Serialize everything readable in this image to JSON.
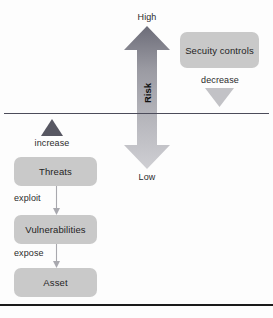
{
  "diagram": {
    "colors": {
      "box_fill": "#c9c9c9",
      "arrow_dark": "#555561",
      "arrow_light": "#bdbdbd",
      "line": "#4c4c5a",
      "rule": "#1a1a1a",
      "text": "#1f1f1f",
      "background": "#fdfdfd"
    },
    "scale": {
      "high_label": "High",
      "low_label": "Low",
      "axis_label": "Risk"
    },
    "security": {
      "box_label": "Secuity controls",
      "effect_label": "decrease",
      "effect_direction": "down"
    },
    "threat_chain": {
      "effect_label": "increase",
      "effect_direction": "up",
      "nodes": [
        {
          "label": "Threats"
        },
        {
          "label": "Vulnerabilities"
        },
        {
          "label": "Asset"
        }
      ],
      "connectors": [
        {
          "label": "exploit"
        },
        {
          "label": "expose"
        }
      ]
    }
  }
}
